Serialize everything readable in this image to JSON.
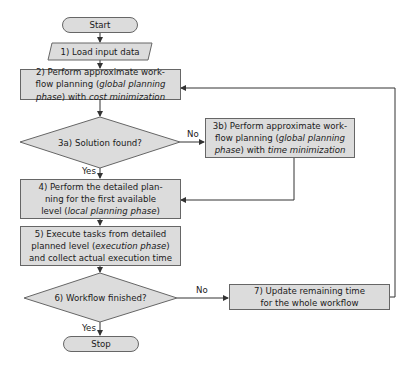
{
  "diagram": {
    "type": "flowchart",
    "colors": {
      "fill": "#dcdcdc",
      "stroke": "#666666",
      "line": "#333333",
      "background": "#ffffff"
    },
    "nodes": {
      "start": {
        "label": "Start",
        "shape": "terminator"
      },
      "n1": {
        "label": "1) Load input data",
        "shape": "parallelogram"
      },
      "n2": {
        "line1": "2) Perform approximate work-",
        "line2a": "flow planning (",
        "line2b": "global planning",
        "line3a": "phase",
        "line3b": ") with ",
        "line3c": "cost minimization",
        "shape": "process"
      },
      "n3a": {
        "label": "3a) Solution found?",
        "shape": "decision"
      },
      "n3b": {
        "line1": "3b) Perform approximate work-",
        "line2a": "flow planning (",
        "line2b": "global planning",
        "line3a": "phase",
        "line3b": ") with ",
        "line3c": "time minimization",
        "shape": "process"
      },
      "n4": {
        "line1": "4) Perform the detailed plan-",
        "line2": "ning for the first available",
        "line3a": "level (",
        "line3b": "local planning phase",
        "line3c": ")",
        "shape": "process"
      },
      "n5": {
        "line1": "5) Execute tasks from detailed",
        "line2a": "planned level (",
        "line2b": "execution phase",
        "line2c": ")",
        "line3": "and collect actual execution time",
        "shape": "process"
      },
      "n6": {
        "label": "6) Workflow finished?",
        "shape": "decision"
      },
      "n7": {
        "line1": "7) Update remaining time",
        "line2": "for the whole workflow",
        "shape": "process"
      },
      "stop": {
        "label": "Stop",
        "shape": "terminator"
      }
    },
    "edge_labels": {
      "n3a_no": "No",
      "n3a_yes": "Yes",
      "n6_no": "No",
      "n6_yes": "Yes"
    },
    "edges": [
      [
        "start",
        "n1"
      ],
      [
        "n1",
        "n2"
      ],
      [
        "n2",
        "n3a"
      ],
      [
        "n3a",
        "n3b",
        "No"
      ],
      [
        "n3a",
        "n4",
        "Yes"
      ],
      [
        "n3b",
        "n4"
      ],
      [
        "n4",
        "n5"
      ],
      [
        "n5",
        "n6"
      ],
      [
        "n6",
        "n7",
        "No"
      ],
      [
        "n6",
        "stop",
        "Yes"
      ],
      [
        "n7",
        "n2"
      ]
    ]
  }
}
